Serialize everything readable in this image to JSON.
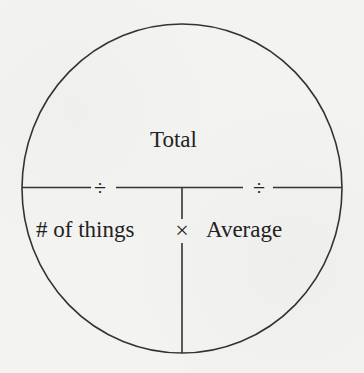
{
  "diagram": {
    "type": "formula-circle",
    "top_label": "Total",
    "bottom_left_label": "# of things",
    "bottom_right_label": "Average",
    "operators": {
      "divide_left": "÷",
      "divide_right": "÷",
      "multiply": "×"
    },
    "colors": {
      "background": "#f3f3f2",
      "stroke": "#333333",
      "text": "#222222"
    }
  }
}
